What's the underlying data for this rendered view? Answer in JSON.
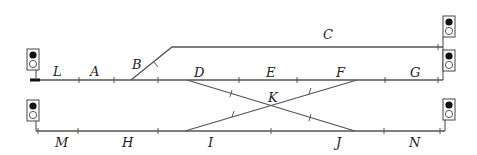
{
  "diagram": {
    "type": "railway-track-layout",
    "colors": {
      "track": "#555555",
      "signal_on": "#111111",
      "text": "#222222"
    },
    "sections": {
      "L": "L",
      "A": "A",
      "B": "B",
      "C": "C",
      "D": "D",
      "E": "E",
      "F": "F",
      "G": "G",
      "K": "K",
      "M": "M",
      "H": "H",
      "I": "I",
      "J": "J",
      "N": "N"
    },
    "tracks": {
      "upper_main": {
        "sections": [
          "L",
          "A",
          "D",
          "E",
          "F",
          "G"
        ]
      },
      "siding": {
        "sections": [
          "B",
          "C"
        ]
      },
      "lower_main": {
        "sections": [
          "M",
          "H",
          "I",
          "J",
          "N"
        ]
      },
      "crossover": {
        "sections": [
          "K"
        ],
        "description": "scissors crossover between upper and lower main lines"
      }
    },
    "signals": [
      {
        "id": "signal-upper-left",
        "position": "left end of upper main",
        "lamps": [
          "on",
          "off"
        ]
      },
      {
        "id": "signal-lower-left",
        "position": "left end of lower main",
        "lamps": [
          "on",
          "off"
        ]
      },
      {
        "id": "signal-siding-right",
        "position": "right end of siding C",
        "lamps": [
          "on",
          "off"
        ]
      },
      {
        "id": "signal-upper-right",
        "position": "right end of upper main",
        "lamps": [
          "on",
          "off"
        ]
      },
      {
        "id": "signal-lower-right",
        "position": "right end of lower main",
        "lamps": [
          "on",
          "off"
        ]
      }
    ]
  }
}
